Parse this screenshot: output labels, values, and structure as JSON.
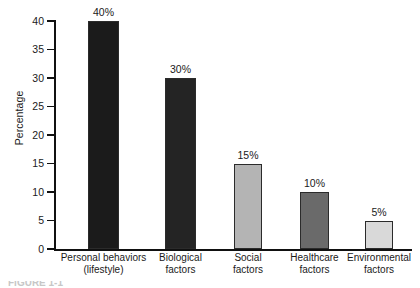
{
  "chart_data": {
    "type": "bar",
    "title": "",
    "xlabel": "",
    "ylabel": "Percentage",
    "ylim": [
      0,
      40
    ],
    "yticks": [
      0,
      5,
      10,
      15,
      20,
      25,
      30,
      35,
      40
    ],
    "ytick_labels": [
      "0",
      "5",
      "10",
      "15",
      "20",
      "25",
      "30",
      "35",
      "40"
    ],
    "grid": false,
    "legend": "none",
    "categories": [
      "Personal behaviors (lifestyle)",
      "Biological factors",
      "Social factors",
      "Healthcare factors",
      "Environmental factors"
    ],
    "values": [
      40,
      30,
      15,
      10,
      5
    ],
    "data_labels": [
      "40%",
      "30%",
      "15%",
      "10%",
      "5%"
    ],
    "bar_colors": [
      "#1b1b1b",
      "#242424",
      "#b4b4b4",
      "#6a6a6a",
      "#d9d9d9"
    ]
  },
  "axes": {
    "y_title": "Percentage",
    "ticks": [
      {
        "value": "40"
      },
      {
        "value": "35"
      },
      {
        "value": "30"
      },
      {
        "value": "25"
      },
      {
        "value": "20"
      },
      {
        "value": "15"
      },
      {
        "value": "10"
      },
      {
        "value": "5"
      },
      {
        "value": "0"
      }
    ]
  },
  "bars": [
    {
      "label_line1": "Personal behaviors",
      "label_line2": "(lifestyle)",
      "value_label": "40%",
      "value": 40,
      "color": "#1b1b1b"
    },
    {
      "label_line1": "Biological",
      "label_line2": "factors",
      "value_label": "30%",
      "value": 30,
      "color": "#242424"
    },
    {
      "label_line1": "Social",
      "label_line2": "factors",
      "value_label": "15%",
      "value": 15,
      "color": "#b4b4b4"
    },
    {
      "label_line1": "Healthcare",
      "label_line2": "factors",
      "value_label": "10%",
      "value": 10,
      "color": "#6a6a6a"
    },
    {
      "label_line1": "Environmental",
      "label_line2": "factors",
      "value_label": "5%",
      "value": 5,
      "color": "#d9d9d9"
    }
  ],
  "caption": {
    "cropped_text": "FIGURE 1-1"
  }
}
